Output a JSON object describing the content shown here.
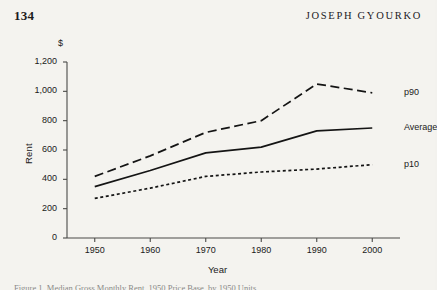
{
  "header": {
    "folio": "134",
    "title": "JOSEPH GYOURKO"
  },
  "caption": {
    "text": "Figure 1. Median Gross Monthly Rent, 1950 Price Base, by 1950 Units"
  },
  "chart_data": {
    "type": "line",
    "title": "",
    "xlabel": "Year",
    "ylabel": "Rent",
    "yunit": "$",
    "x": [
      1950,
      1960,
      1970,
      1980,
      1990,
      2000
    ],
    "xtick_labels": [
      "1950",
      "1960",
      "1970",
      "1980",
      "1990",
      "2000"
    ],
    "ytick_labels": [
      "0",
      "200",
      "400",
      "600",
      "800",
      "1,000",
      "1,200"
    ],
    "yticks": [
      0,
      200,
      400,
      600,
      800,
      1000,
      1200
    ],
    "xlim": [
      1945,
      2005
    ],
    "ylim": [
      0,
      1200
    ],
    "grid": false,
    "legend_position": "right-inline",
    "series": [
      {
        "name": "p90",
        "label": "p90",
        "style": "long-dash",
        "color": "#141414",
        "values": [
          420,
          560,
          720,
          800,
          1050,
          990
        ]
      },
      {
        "name": "Average",
        "label": "Average",
        "style": "solid",
        "color": "#141414",
        "values": [
          350,
          460,
          580,
          620,
          730,
          750
        ]
      },
      {
        "name": "p10",
        "label": "p10",
        "style": "short-dash",
        "color": "#141414",
        "values": [
          270,
          340,
          420,
          450,
          470,
          500
        ]
      }
    ]
  }
}
